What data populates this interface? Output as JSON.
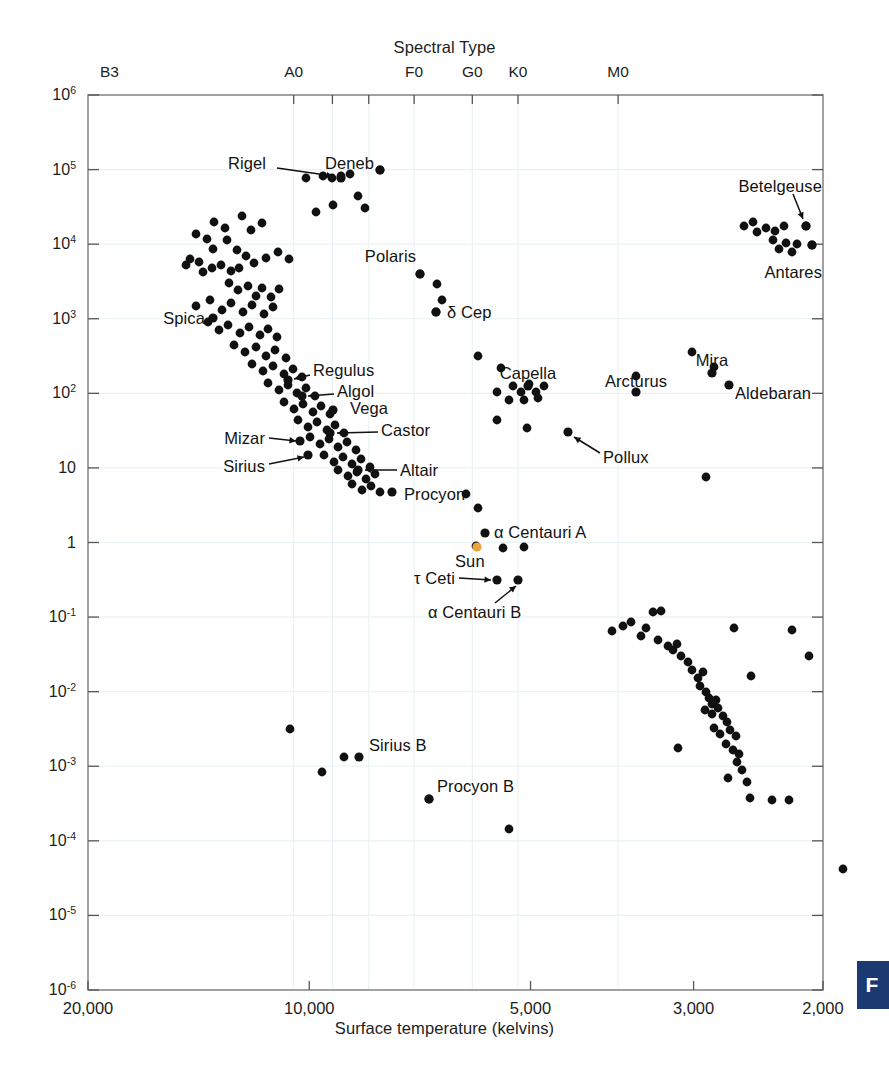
{
  "figure": {
    "kind": "hertzsprung-russell-diagram",
    "corner_badge_text": "F",
    "corner_badge_color": "#1b3a72"
  },
  "axes": {
    "top_title": "Spectral Type",
    "bottom_title": "Surface temperature (kelvins)",
    "spectral_ticks": [
      {
        "label": "B3",
        "temp": 18700
      },
      {
        "label": "A0",
        "temp": 10500
      },
      {
        "label": "F0",
        "temp": 7200
      },
      {
        "label": "G0",
        "temp": 6000
      },
      {
        "label": "K0",
        "temp": 5200
      },
      {
        "label": "M0",
        "temp": 3800
      }
    ],
    "spectral_tick_marks_temp": [
      10500,
      9300,
      8300,
      7200,
      6000,
      5200,
      3800
    ],
    "x_tick_labels": [
      "20,000",
      "10,000",
      "5,000",
      "3,000",
      "2,000"
    ],
    "x_tick_values": [
      20000,
      10000,
      5000,
      3000,
      2000
    ],
    "x_range": [
      20000,
      2000
    ],
    "x_scale": "log-reversed",
    "y_tick_labels": [
      {
        "mant": "10",
        "exp": "6"
      },
      {
        "mant": "10",
        "exp": "5"
      },
      {
        "mant": "10",
        "exp": "4"
      },
      {
        "mant": "10",
        "exp": "3"
      },
      {
        "mant": "10",
        "exp": "2"
      },
      {
        "mant": "10",
        "exp": ""
      },
      {
        "mant": "1",
        "exp": ""
      },
      {
        "mant": "10",
        "exp": "-1"
      },
      {
        "mant": "10",
        "exp": "-2"
      },
      {
        "mant": "10",
        "exp": "-3"
      },
      {
        "mant": "10",
        "exp": "-4"
      },
      {
        "mant": "10",
        "exp": "-5"
      },
      {
        "mant": "10",
        "exp": "-6"
      }
    ],
    "y_range": [
      1e-06,
      1000000.0
    ],
    "y_scale": "log",
    "grid": true,
    "grid_color": "#e8f2f4",
    "frame_color": "#7a7a7a"
  },
  "chart_data": {
    "type": "scatter",
    "title": "Spectral Type",
    "xlabel": "Surface temperature (kelvins)",
    "ylabel": "",
    "xlim": [
      20000,
      2000
    ],
    "ylim": [
      1e-06,
      1000000.0
    ],
    "xscale": "log-reversed",
    "yscale": "log",
    "grid": true,
    "legend": "none",
    "point_color": "#111111",
    "sun_color": "#e8a33d",
    "named_stars": [
      {
        "name": "Rigel",
        "temp": 11300,
        "lum": 46000,
        "label_pos": "above-left",
        "leader": true
      },
      {
        "name": "Deneb",
        "temp": 9800,
        "lum": 60000,
        "label_pos": "above",
        "leader": false
      },
      {
        "name": "Betelgeuse",
        "temp": 3500,
        "lum": 19000,
        "label_pos": "above-left",
        "leader": true
      },
      {
        "name": "Antares",
        "temp": 3400,
        "lum": 6500,
        "label_pos": "below-left",
        "leader": false
      },
      {
        "name": "Polaris",
        "temp": 7000,
        "lum": 5500,
        "label_pos": "above-left",
        "leader": false
      },
      {
        "name": "δ Cep",
        "temp": 6400,
        "lum": 1400,
        "label_pos": "right",
        "leader": false
      },
      {
        "name": "Spica",
        "temp": 13500,
        "lum": 1000,
        "label_pos": "left",
        "leader": false
      },
      {
        "name": "Regulus",
        "temp": 10800,
        "lum": 160,
        "label_pos": "right",
        "leader": true
      },
      {
        "name": "Algol",
        "temp": 10000,
        "lum": 85,
        "label_pos": "right",
        "leader": true
      },
      {
        "name": "Vega",
        "temp": 9600,
        "lum": 50,
        "label_pos": "right",
        "leader": false
      },
      {
        "name": "Castor",
        "temp": 8800,
        "lum": 30,
        "label_pos": "right",
        "leader": true
      },
      {
        "name": "Mizar",
        "temp": 9000,
        "lum": 25,
        "label_pos": "left",
        "leader": true
      },
      {
        "name": "Sirius",
        "temp": 9200,
        "lum": 22,
        "label_pos": "left",
        "leader": true
      },
      {
        "name": "Altair",
        "temp": 8000,
        "lum": 11,
        "label_pos": "right",
        "leader": true
      },
      {
        "name": "Procyon",
        "temp": 7400,
        "lum": 6.5,
        "label_pos": "right",
        "leader": false
      },
      {
        "name": "Capella",
        "temp": 5800,
        "lum": 130,
        "label_pos": "above",
        "leader": false
      },
      {
        "name": "Arcturus",
        "temp": 4400,
        "lum": 110,
        "label_pos": "above-left",
        "leader": false
      },
      {
        "name": "Mira",
        "temp": 3100,
        "lum": 190,
        "label_pos": "above",
        "leader": false
      },
      {
        "name": "Aldebaran",
        "temp": 2950,
        "lum": 130,
        "label_pos": "right",
        "leader": false
      },
      {
        "name": "Pollux",
        "temp": 4700,
        "lum": 32,
        "label_pos": "right",
        "leader": true
      },
      {
        "name": "α Centauri A",
        "temp": 5700,
        "lum": 1.5,
        "label_pos": "right",
        "leader": false
      },
      {
        "name": "Sun",
        "temp": 5800,
        "lum": 1.0,
        "label_pos": "below",
        "leader": false,
        "highlight": true
      },
      {
        "name": "τ Ceti",
        "temp": 5400,
        "lum": 0.45,
        "label_pos": "left",
        "leader": true
      },
      {
        "name": "α Centauri B",
        "temp": 5000,
        "lum": 0.38,
        "label_pos": "below-left",
        "leader": true
      },
      {
        "name": "Sirius B",
        "temp": 9400,
        "lum": 0.0017,
        "label_pos": "above-right",
        "leader": false
      },
      {
        "name": "Procyon B",
        "temp": 7900,
        "lum": 0.00045,
        "label_pos": "above-right",
        "leader": false
      }
    ],
    "points_px": [
      [
        214,
        222
      ],
      [
        225,
        228
      ],
      [
        242,
        216
      ],
      [
        251,
        230
      ],
      [
        262,
        223
      ],
      [
        196,
        234
      ],
      [
        207,
        239
      ],
      [
        190,
        259
      ],
      [
        213,
        249
      ],
      [
        227,
        240
      ],
      [
        237,
        250
      ],
      [
        186,
        265
      ],
      [
        199,
        262
      ],
      [
        203,
        272
      ],
      [
        212,
        268
      ],
      [
        221,
        265
      ],
      [
        231,
        271
      ],
      [
        239,
        268
      ],
      [
        246,
        256
      ],
      [
        254,
        263
      ],
      [
        266,
        258
      ],
      [
        278,
        252
      ],
      [
        289,
        259
      ],
      [
        229,
        283
      ],
      [
        238,
        290
      ],
      [
        248,
        286
      ],
      [
        256,
        296
      ],
      [
        262,
        288
      ],
      [
        271,
        297
      ],
      [
        279,
        289
      ],
      [
        196,
        306
      ],
      [
        210,
        300
      ],
      [
        222,
        310
      ],
      [
        231,
        303
      ],
      [
        243,
        312
      ],
      [
        252,
        305
      ],
      [
        264,
        314
      ],
      [
        273,
        307
      ],
      [
        208,
        322
      ],
      [
        219,
        330
      ],
      [
        228,
        325
      ],
      [
        240,
        333
      ],
      [
        249,
        327
      ],
      [
        260,
        335
      ],
      [
        268,
        329
      ],
      [
        277,
        337
      ],
      [
        234,
        345
      ],
      [
        245,
        352
      ],
      [
        256,
        347
      ],
      [
        266,
        356
      ],
      [
        275,
        350
      ],
      [
        286,
        358
      ],
      [
        252,
        364
      ],
      [
        263,
        371
      ],
      [
        273,
        366
      ],
      [
        284,
        374
      ],
      [
        293,
        369
      ],
      [
        302,
        377
      ],
      [
        268,
        383
      ],
      [
        279,
        390
      ],
      [
        288,
        385
      ],
      [
        297,
        393
      ],
      [
        306,
        388
      ],
      [
        315,
        396
      ],
      [
        284,
        402
      ],
      [
        294,
        409
      ],
      [
        303,
        404
      ],
      [
        313,
        412
      ],
      [
        321,
        406
      ],
      [
        330,
        414
      ],
      [
        298,
        420
      ],
      [
        308,
        427
      ],
      [
        317,
        422
      ],
      [
        327,
        430
      ],
      [
        335,
        425
      ],
      [
        344,
        433
      ],
      [
        310,
        437
      ],
      [
        320,
        444
      ],
      [
        329,
        439
      ],
      [
        338,
        447
      ],
      [
        347,
        442
      ],
      [
        356,
        450
      ],
      [
        324,
        455
      ],
      [
        334,
        462
      ],
      [
        343,
        457
      ],
      [
        352,
        464
      ],
      [
        361,
        459
      ],
      [
        370,
        467
      ],
      [
        338,
        470
      ],
      [
        348,
        476
      ],
      [
        357,
        472
      ],
      [
        366,
        479
      ],
      [
        375,
        474
      ],
      [
        352,
        484
      ],
      [
        362,
        490
      ],
      [
        371,
        486
      ],
      [
        380,
        492
      ],
      [
        306,
        178
      ],
      [
        323,
        176
      ],
      [
        332,
        178
      ],
      [
        341,
        176
      ],
      [
        350,
        174
      ],
      [
        380,
        170
      ],
      [
        358,
        196
      ],
      [
        365,
        208
      ],
      [
        333,
        205
      ],
      [
        316,
        212
      ],
      [
        420,
        274
      ],
      [
        437,
        284
      ],
      [
        442,
        300
      ],
      [
        436,
        312
      ],
      [
        478,
        356
      ],
      [
        501,
        368
      ],
      [
        497,
        392
      ],
      [
        513,
        386
      ],
      [
        521,
        392
      ],
      [
        529,
        384
      ],
      [
        536,
        392
      ],
      [
        544,
        386
      ],
      [
        509,
        400
      ],
      [
        524,
        400
      ],
      [
        538,
        398
      ],
      [
        497,
        420
      ],
      [
        527,
        428
      ],
      [
        636,
        376
      ],
      [
        692,
        352
      ],
      [
        714,
        367
      ],
      [
        744,
        226
      ],
      [
        757,
        232
      ],
      [
        766,
        228
      ],
      [
        775,
        231
      ],
      [
        784,
        226
      ],
      [
        773,
        240
      ],
      [
        779,
        249
      ],
      [
        786,
        243
      ],
      [
        792,
        252
      ],
      [
        797,
        244
      ],
      [
        753,
        222
      ],
      [
        806,
        226
      ],
      [
        812,
        245
      ],
      [
        706,
        477
      ],
      [
        466,
        494
      ],
      [
        478,
        508
      ],
      [
        476,
        546
      ],
      [
        503,
        548
      ],
      [
        524,
        547
      ],
      [
        612,
        631
      ],
      [
        623,
        626
      ],
      [
        631,
        622
      ],
      [
        646,
        628
      ],
      [
        653,
        612
      ],
      [
        661,
        611
      ],
      [
        641,
        636
      ],
      [
        658,
        640
      ],
      [
        668,
        646
      ],
      [
        673,
        650
      ],
      [
        677,
        644
      ],
      [
        681,
        656
      ],
      [
        688,
        662
      ],
      [
        692,
        670
      ],
      [
        698,
        678
      ],
      [
        703,
        672
      ],
      [
        700,
        686
      ],
      [
        706,
        692
      ],
      [
        709,
        698
      ],
      [
        712,
        704
      ],
      [
        716,
        700
      ],
      [
        705,
        710
      ],
      [
        712,
        714
      ],
      [
        718,
        708
      ],
      [
        723,
        716
      ],
      [
        727,
        722
      ],
      [
        714,
        728
      ],
      [
        720,
        734
      ],
      [
        730,
        730
      ],
      [
        736,
        736
      ],
      [
        726,
        744
      ],
      [
        733,
        750
      ],
      [
        739,
        754
      ],
      [
        737,
        762
      ],
      [
        742,
        770
      ],
      [
        728,
        778
      ],
      [
        747,
        782
      ],
      [
        750,
        798
      ],
      [
        772,
        800
      ],
      [
        789,
        800
      ],
      [
        734,
        628
      ],
      [
        678,
        748
      ],
      [
        751,
        676
      ],
      [
        290,
        729
      ],
      [
        322,
        772
      ],
      [
        344,
        757
      ],
      [
        429,
        799
      ],
      [
        509,
        829
      ],
      [
        843,
        869
      ],
      [
        792,
        630
      ],
      [
        809,
        656
      ]
    ]
  }
}
